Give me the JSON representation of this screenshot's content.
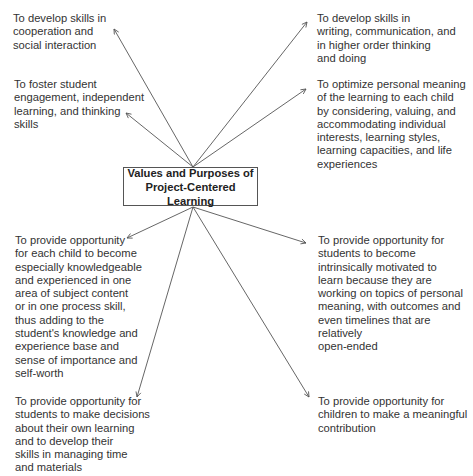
{
  "diagram": {
    "center": {
      "label": "Values and Purposes of\nProject-Centered Learning"
    },
    "nodes": [
      {
        "id": "cooperation",
        "text": "To develop skills in\ncooperation and\nsocial interaction"
      },
      {
        "id": "engagement",
        "text": "To foster student\nengagement, independent\nlearning, and thinking\nskills"
      },
      {
        "id": "knowledgeable",
        "text": "To provide opportunity\nfor each child to become\nespecially knowledgeable\nand experienced in one\narea of subject content\nor in one process skill,\nthus adding to the\nstudent's knowledge and\nexperience base and\nsense of importance and\nself-worth"
      },
      {
        "id": "decisions",
        "text": "To provide opportunity for\nstudents to make decisions\nabout their own learning\nand to develop their\nskills in managing time\nand materials"
      },
      {
        "id": "writing",
        "text": "To develop skills in\nwriting, communication, and\nin higher order thinking\nand doing"
      },
      {
        "id": "personal-meaning",
        "text": "To optimize personal meaning\nof the learning to each child\nby considering, valuing, and\naccommodating individual\ninterests, learning styles,\nlearning capacities, and life\nexperiences"
      },
      {
        "id": "motivated",
        "text": "To provide opportunity for\nstudents to become\nintrinsically motivated to\nlearn because they are\nworking on topics of personal\nmeaning, with outcomes and\neven timelines that are relatively\nopen-ended"
      },
      {
        "id": "contribution",
        "text": "To provide opportunity for\nchildren to make a meaningful\ncontribution"
      }
    ],
    "colors": {
      "line": "#555555",
      "text": "#333333"
    }
  }
}
